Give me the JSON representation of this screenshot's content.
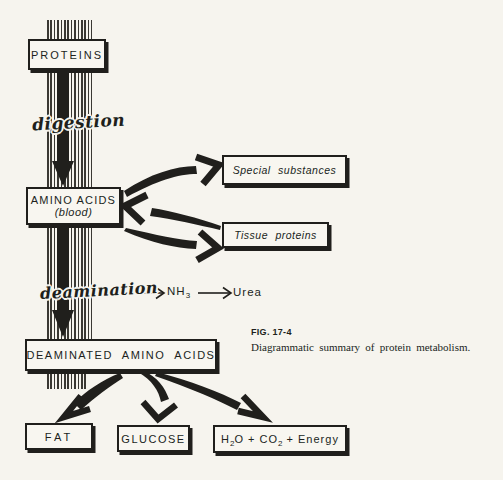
{
  "figure": {
    "number": "FIG. 17-4",
    "caption": "Diagrammatic summary of protein metabolism."
  },
  "nodes": {
    "proteins": "PROTEINS",
    "amino_acids": "AMINO ACIDS",
    "amino_acids_note": "(blood)",
    "special_substances": "Special substances",
    "tissue_proteins": "Tissue proteins",
    "deaminated_amino_acids": "DEAMINATED AMINO ACIDS",
    "fat": "FAT",
    "glucose": "GLUCOSE",
    "energy": {
      "h": "H",
      "sub1": "2",
      "o_plus_co": "O + CO",
      "sub2": "2",
      "plus_energy": "+ Energy"
    }
  },
  "processes": {
    "digestion": "digestion",
    "deamination": "deamination"
  },
  "byproducts": {
    "nh": "NH",
    "nh_sub": "3",
    "urea": "Urea"
  },
  "colors": {
    "paper": "#f6f4ee",
    "ink": "#201f1c"
  }
}
